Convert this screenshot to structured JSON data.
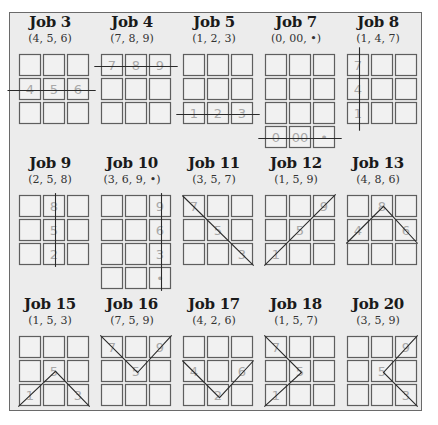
{
  "diagram": {
    "cell_size": 21,
    "cell_pitch": 24,
    "jobs": [
      {
        "id": "job-3",
        "title": "Job 3",
        "code": "(4, 5, 6)",
        "rows": 3,
        "labels": [
          {
            "r": 1,
            "c": 0,
            "t": "4"
          },
          {
            "r": 1,
            "c": 1,
            "t": "5"
          },
          {
            "r": 1,
            "c": 2,
            "t": "6"
          }
        ],
        "path": [
          [
            -0.5,
            1.5
          ],
          [
            3.3,
            1.5
          ]
        ]
      },
      {
        "id": "job-4",
        "title": "Job 4",
        "code": "(7, 8, 9)",
        "rows": 3,
        "labels": [
          {
            "r": 0,
            "c": 0,
            "t": "7"
          },
          {
            "r": 0,
            "c": 1,
            "t": "8"
          },
          {
            "r": 0,
            "c": 2,
            "t": "9"
          }
        ],
        "path": [
          [
            -0.3,
            0.5
          ],
          [
            3.3,
            0.5
          ]
        ]
      },
      {
        "id": "job-5",
        "title": "Job 5",
        "code": "(1, 2, 3)",
        "rows": 3,
        "labels": [
          {
            "r": 2,
            "c": 0,
            "t": "1"
          },
          {
            "r": 2,
            "c": 1,
            "t": "2"
          },
          {
            "r": 2,
            "c": 2,
            "t": "3"
          }
        ],
        "path": [
          [
            -0.3,
            2.5
          ],
          [
            3.3,
            2.5
          ]
        ]
      },
      {
        "id": "job-7",
        "title": "Job 7",
        "code": "(0, 00, •)",
        "rows": 4,
        "labels": [
          {
            "r": 3,
            "c": 0,
            "t": "0"
          },
          {
            "r": 3,
            "c": 1,
            "t": "00"
          },
          {
            "r": 3,
            "c": 2,
            "t": "•"
          }
        ],
        "path": [
          [
            -0.3,
            3.5
          ],
          [
            3.3,
            3.5
          ]
        ]
      },
      {
        "id": "job-8",
        "title": "Job 8",
        "code": "(1, 4, 7)",
        "rows": 3,
        "labels": [
          {
            "r": 0,
            "c": 0,
            "t": "7"
          },
          {
            "r": 1,
            "c": 0,
            "t": "4"
          },
          {
            "r": 2,
            "c": 0,
            "t": "1"
          }
        ],
        "path": [
          [
            0.5,
            -0.3
          ],
          [
            0.5,
            3.3
          ]
        ]
      },
      {
        "id": "job-9",
        "title": "Job 9",
        "code": "(2, 5, 8)",
        "rows": 3,
        "labels": [
          {
            "r": 0,
            "c": 1,
            "t": "8"
          },
          {
            "r": 1,
            "c": 1,
            "t": "5"
          },
          {
            "r": 2,
            "c": 1,
            "t": "2"
          }
        ],
        "path": [
          [
            1.5,
            -0.1
          ],
          [
            1.5,
            3.1
          ]
        ]
      },
      {
        "id": "job-10",
        "title": "Job 10",
        "code": "(3, 6, 9, •)",
        "rows": 4,
        "labels": [
          {
            "r": 0,
            "c": 2,
            "t": "9"
          },
          {
            "r": 1,
            "c": 2,
            "t": "6"
          },
          {
            "r": 2,
            "c": 2,
            "t": "3"
          },
          {
            "r": 3,
            "c": 2,
            "t": "•"
          }
        ],
        "path": [
          [
            2.5,
            -0.1
          ],
          [
            2.5,
            4.1
          ]
        ]
      },
      {
        "id": "job-11",
        "title": "Job 11",
        "code": "(3, 5, 7)",
        "rows": 3,
        "labels": [
          {
            "r": 0,
            "c": 0,
            "t": "7"
          },
          {
            "r": 1,
            "c": 1,
            "t": "5"
          },
          {
            "r": 2,
            "c": 2,
            "t": "3"
          }
        ],
        "path": [
          [
            -0.05,
            0
          ],
          [
            3.05,
            3.05
          ]
        ]
      },
      {
        "id": "job-12",
        "title": "Job 12",
        "code": "(1, 5, 9)",
        "rows": 3,
        "labels": [
          {
            "r": 2,
            "c": 0,
            "t": "1"
          },
          {
            "r": 1,
            "c": 1,
            "t": "5"
          },
          {
            "r": 0,
            "c": 2,
            "t": "9"
          }
        ],
        "path": [
          [
            -0.05,
            3.05
          ],
          [
            3.05,
            -0.05
          ]
        ]
      },
      {
        "id": "job-13",
        "title": "Job 13",
        "code": "(4, 8, 6)",
        "rows": 3,
        "labels": [
          {
            "r": 1,
            "c": 0,
            "t": "4"
          },
          {
            "r": 0,
            "c": 1,
            "t": "8"
          },
          {
            "r": 1,
            "c": 2,
            "t": "6"
          }
        ],
        "path": [
          [
            -0.05,
            2.0
          ],
          [
            1.5,
            0.45
          ],
          [
            3.05,
            2.0
          ]
        ]
      },
      {
        "id": "job-15",
        "title": "Job 15",
        "code": "(1, 5, 3)",
        "rows": 3,
        "labels": [
          {
            "r": 2,
            "c": 0,
            "t": "1"
          },
          {
            "r": 1,
            "c": 1,
            "t": "5"
          },
          {
            "r": 2,
            "c": 2,
            "t": "3"
          }
        ],
        "path": [
          [
            -0.05,
            3.05
          ],
          [
            1.5,
            1.45
          ],
          [
            3.05,
            3.05
          ]
        ]
      },
      {
        "id": "job-16",
        "title": "Job 16",
        "code": "(7, 5, 9)",
        "rows": 3,
        "labels": [
          {
            "r": 0,
            "c": 0,
            "t": "7"
          },
          {
            "r": 1,
            "c": 1,
            "t": "5"
          },
          {
            "r": 0,
            "c": 2,
            "t": "9"
          }
        ],
        "path": [
          [
            -0.05,
            -0.05
          ],
          [
            1.5,
            1.5
          ],
          [
            3.05,
            -0.05
          ]
        ]
      },
      {
        "id": "job-17",
        "title": "Job 17",
        "code": "(4, 2, 6)",
        "rows": 3,
        "labels": [
          {
            "r": 1,
            "c": 0,
            "t": "4"
          },
          {
            "r": 2,
            "c": 1,
            "t": "2"
          },
          {
            "r": 1,
            "c": 2,
            "t": "6"
          }
        ],
        "path": [
          [
            -0.05,
            1.0
          ],
          [
            1.5,
            2.55
          ],
          [
            3.05,
            1.0
          ]
        ]
      },
      {
        "id": "job-18",
        "title": "Job 18",
        "code": "(1, 5, 7)",
        "rows": 3,
        "labels": [
          {
            "r": 0,
            "c": 0,
            "t": "7"
          },
          {
            "r": 1,
            "c": 1,
            "t": "5"
          },
          {
            "r": 2,
            "c": 0,
            "t": "1"
          }
        ],
        "path": [
          [
            -0.05,
            -0.05
          ],
          [
            1.5,
            1.5
          ],
          [
            -0.05,
            3.05
          ]
        ]
      },
      {
        "id": "job-20",
        "title": "Job 20",
        "code": "(3, 5, 9)",
        "rows": 3,
        "labels": [
          {
            "r": 0,
            "c": 2,
            "t": "9"
          },
          {
            "r": 1,
            "c": 1,
            "t": "5"
          },
          {
            "r": 2,
            "c": 2,
            "t": "3"
          }
        ],
        "path": [
          [
            3.05,
            -0.05
          ],
          [
            1.5,
            1.5
          ],
          [
            3.05,
            3.05
          ]
        ]
      }
    ]
  }
}
